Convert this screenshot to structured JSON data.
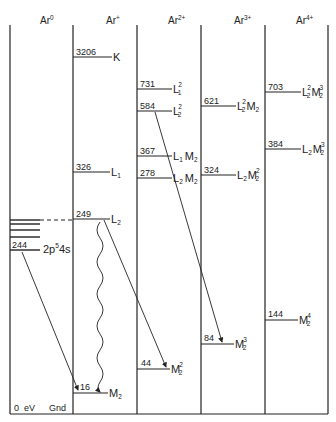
{
  "columns": [
    {
      "id": "ar0",
      "header": "Ar",
      "charge": "0"
    },
    {
      "id": "ar1",
      "header": "Ar",
      "charge": "+"
    },
    {
      "id": "ar2",
      "header": "Ar",
      "charge": "2+"
    },
    {
      "id": "ar3",
      "header": "Ar",
      "charge": "3+"
    },
    {
      "id": "ar4",
      "header": "Ar",
      "charge": "4+"
    }
  ],
  "ar0": {
    "level_244": {
      "value": "244",
      "label": "2p",
      "sup": "5",
      "rest": "4s"
    },
    "ground": {
      "value": "0",
      "unit": "eV",
      "label": "Gnd"
    }
  },
  "ar1": {
    "levels": [
      {
        "value": "3206",
        "label": "K"
      },
      {
        "value": "326",
        "label": "L",
        "sub": "1"
      },
      {
        "value": "249",
        "label": "L",
        "sub": "2"
      },
      {
        "value": "16",
        "label": "M",
        "sub": "2"
      }
    ]
  },
  "ar2": {
    "levels": [
      {
        "value": "731",
        "label": "L",
        "sub": "1",
        "sup": "2"
      },
      {
        "value": "584",
        "label": "L",
        "sub": "2",
        "sup": "2"
      },
      {
        "value": "367",
        "label": "L",
        "sub": "1",
        "label2": "M",
        "sub2": "2"
      },
      {
        "value": "278",
        "label": "L",
        "sub": "2",
        "label2": "M",
        "sub2": "2"
      },
      {
        "value": "44",
        "label": "M",
        "sub": "2",
        "sup": "2"
      }
    ]
  },
  "ar3": {
    "levels": [
      {
        "value": "621",
        "label": "L",
        "sub": "2",
        "sup": "2",
        "label2": "M",
        "sub2": "2"
      },
      {
        "value": "324",
        "label": "L",
        "sub": "2",
        "label2": "M",
        "sub2": "2",
        "sup2": "2"
      },
      {
        "value": "84",
        "label": "M",
        "sub": "2",
        "sup": "3"
      }
    ]
  },
  "ar4": {
    "levels": [
      {
        "value": "703",
        "label": "L",
        "sub": "2",
        "sup": "2",
        "label2": "M",
        "sub2": "2",
        "sup2": "3"
      },
      {
        "value": "384",
        "label": "L",
        "sub": "2",
        "label2": "M",
        "sub2": "2",
        "sup2": "3"
      },
      {
        "value": "144",
        "label": "M",
        "sub": "2",
        "sup": "4"
      }
    ]
  }
}
